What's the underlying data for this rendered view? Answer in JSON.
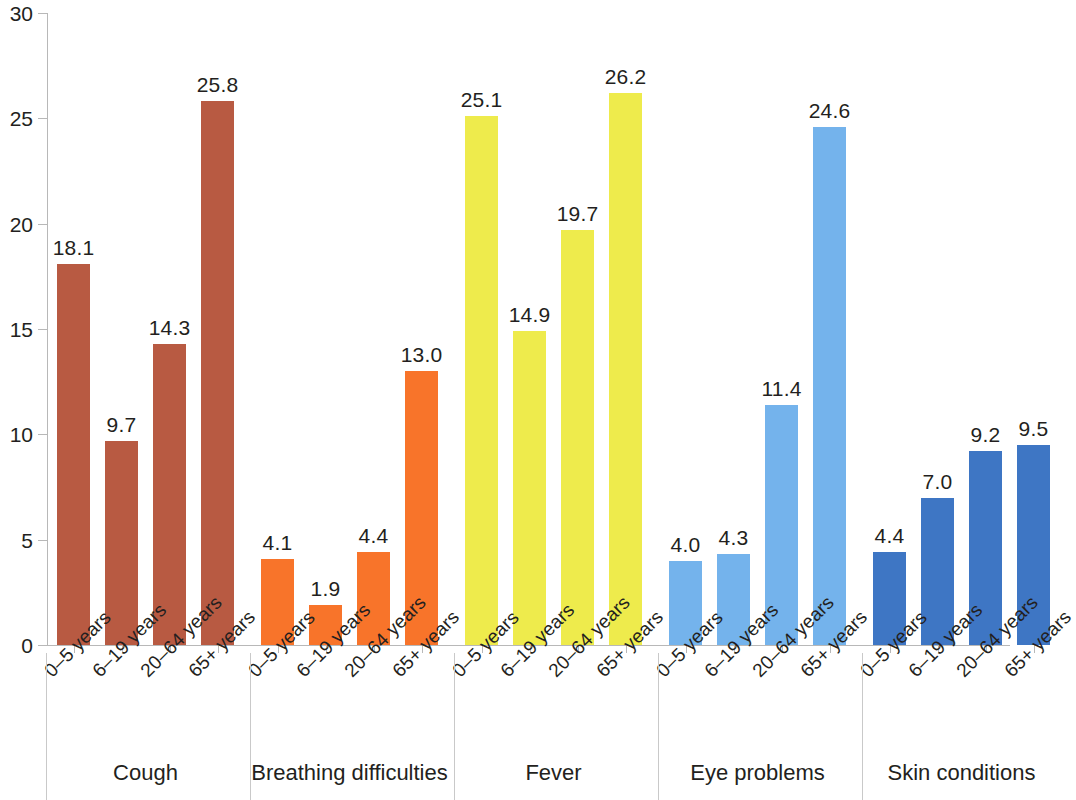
{
  "chart_data": {
    "type": "bar",
    "title": "",
    "subtitle": "",
    "xlabel": "",
    "ylabel": "",
    "ylim": [
      0,
      30
    ],
    "yticks": [
      0,
      5,
      10,
      15,
      20,
      25,
      30
    ],
    "ytick_labels": [
      "0",
      "5",
      "10",
      "15",
      "20",
      "25",
      "30"
    ],
    "grid": false,
    "legend": "none",
    "categories": [
      "0–5 years",
      "6–19 years",
      "20–64 years",
      "65+ years"
    ],
    "groups": [
      {
        "name": "Cough",
        "color": "#b85a42",
        "categories": [
          "0–5 years",
          "6–19 years",
          "20–64 years",
          "65+ years"
        ],
        "values": [
          18.1,
          9.7,
          14.3,
          25.8
        ],
        "labels": [
          "18.1",
          "9.7",
          "14.3",
          "25.8"
        ]
      },
      {
        "name": "Breathing difficulties",
        "color": "#f8742a",
        "categories": [
          "0–5 years",
          "6–19 years",
          "20–64 years",
          "65+ years"
        ],
        "values": [
          4.1,
          1.9,
          4.4,
          13.0
        ],
        "labels": [
          "4.1",
          "1.9",
          "4.4",
          "13.0"
        ]
      },
      {
        "name": "Fever",
        "color": "#eeeb4c",
        "categories": [
          "0–5 years",
          "6–19 years",
          "20–64 years",
          "65+ years"
        ],
        "values": [
          25.1,
          14.9,
          19.7,
          26.2
        ],
        "labels": [
          "25.1",
          "14.9",
          "19.7",
          "26.2"
        ]
      },
      {
        "name": "Eye problems",
        "color": "#74b3ec",
        "categories": [
          "0–5 years",
          "6–19 years",
          "20–64 years",
          "65+ years"
        ],
        "values": [
          4.0,
          4.3,
          11.4,
          24.6
        ],
        "labels": [
          "4.0",
          "4.3",
          "11.4",
          "24.6"
        ]
      },
      {
        "name": "Skin conditions",
        "color": "#3e76c4",
        "categories": [
          "0–5 years",
          "6–19 years",
          "20–64 years",
          "65+ years"
        ],
        "values": [
          4.4,
          7.0,
          9.2,
          9.5
        ],
        "labels": [
          "4.4",
          "7.0",
          "9.2",
          "9.5"
        ]
      }
    ]
  },
  "axis": {
    "y_tick_labels": [
      "30",
      "25",
      "20",
      "15",
      "10",
      "5",
      "0"
    ]
  }
}
